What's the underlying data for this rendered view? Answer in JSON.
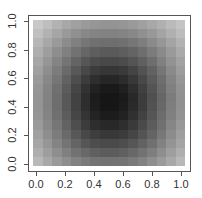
{
  "chart_data": {
    "type": "heatmap",
    "title": "",
    "xlabel": "",
    "ylabel": "",
    "xlim": [
      0.0,
      1.0
    ],
    "ylim": [
      0.0,
      1.0
    ],
    "x_ticks": [
      "0.0",
      "0.2",
      "0.4",
      "0.6",
      "0.8",
      "1.0"
    ],
    "y_ticks": [
      "0.0",
      "0.2",
      "0.4",
      "0.6",
      "0.8",
      "1.0"
    ],
    "colormap": "grayscale (dark = low, light = high)",
    "grid": false,
    "legend": null,
    "grid_size": [
      16,
      16
    ],
    "matrix_rows_top_to_bottom_gray": [
      [
        200,
        190,
        178,
        168,
        160,
        154,
        150,
        148,
        148,
        150,
        154,
        160,
        168,
        176,
        186,
        196
      ],
      [
        192,
        178,
        166,
        154,
        144,
        136,
        132,
        130,
        130,
        132,
        136,
        144,
        152,
        164,
        176,
        188
      ],
      [
        182,
        168,
        154,
        140,
        128,
        118,
        112,
        110,
        110,
        112,
        118,
        126,
        138,
        150,
        164,
        178
      ],
      [
        174,
        158,
        142,
        128,
        114,
        102,
        94,
        90,
        90,
        94,
        100,
        110,
        124,
        138,
        154,
        170
      ],
      [
        166,
        150,
        132,
        116,
        100,
        86,
        76,
        72,
        72,
        76,
        84,
        96,
        110,
        128,
        146,
        162
      ],
      [
        160,
        142,
        124,
        106,
        88,
        72,
        60,
        54,
        54,
        58,
        68,
        82,
        98,
        118,
        138,
        156
      ],
      [
        154,
        136,
        118,
        98,
        78,
        60,
        46,
        38,
        38,
        44,
        56,
        72,
        90,
        110,
        132,
        150
      ],
      [
        150,
        132,
        112,
        92,
        70,
        50,
        34,
        26,
        26,
        32,
        46,
        64,
        84,
        106,
        128,
        146
      ],
      [
        148,
        130,
        110,
        88,
        66,
        46,
        28,
        22,
        22,
        26,
        40,
        60,
        80,
        102,
        124,
        144
      ],
      [
        148,
        130,
        110,
        88,
        66,
        46,
        30,
        22,
        22,
        28,
        42,
        60,
        82,
        104,
        126,
        144
      ],
      [
        150,
        132,
        112,
        92,
        70,
        52,
        36,
        28,
        28,
        34,
        48,
        66,
        86,
        108,
        128,
        146
      ],
      [
        154,
        136,
        118,
        98,
        78,
        60,
        46,
        40,
        40,
        46,
        58,
        74,
        92,
        112,
        134,
        152
      ],
      [
        160,
        142,
        124,
        106,
        88,
        72,
        62,
        56,
        56,
        60,
        70,
        84,
        100,
        120,
        140,
        158
      ],
      [
        166,
        150,
        132,
        116,
        100,
        86,
        78,
        74,
        74,
        78,
        86,
        98,
        112,
        130,
        148,
        164
      ],
      [
        174,
        158,
        142,
        128,
        114,
        104,
        96,
        92,
        92,
        96,
        104,
        114,
        126,
        142,
        158,
        174
      ],
      [
        184,
        168,
        154,
        142,
        130,
        122,
        116,
        114,
        114,
        116,
        122,
        130,
        142,
        154,
        168,
        184
      ]
    ]
  }
}
